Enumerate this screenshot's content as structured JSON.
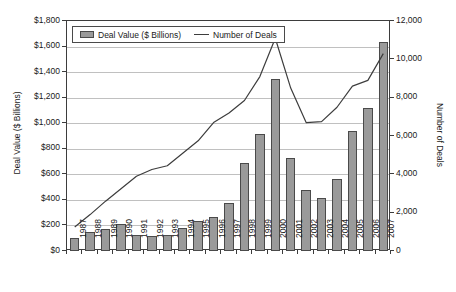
{
  "chart_data": {
    "type": "bar",
    "title": "",
    "xlabel": "",
    "ylabel": "Deal Value ($ Billions)",
    "y2label": "Number of Deals",
    "ylim": [
      0,
      1800
    ],
    "y2lim": [
      0,
      12000
    ],
    "grid": true,
    "legend_position": "top-left-inside",
    "categories": [
      "1987",
      "1988",
      "1989",
      "1990",
      "1991",
      "1992",
      "1993",
      "1994",
      "1995",
      "1996",
      "1997",
      "1998",
      "1999",
      "2000",
      "2001",
      "2002",
      "2003",
      "2004",
      "2005",
      "2006",
      "2007"
    ],
    "y_ticks": [
      "$0",
      "$200",
      "$400",
      "$600",
      "$800",
      "$1,000",
      "$1,200",
      "$1,400",
      "$1,600",
      "$1,800"
    ],
    "y_tick_values": [
      0,
      200,
      400,
      600,
      800,
      1000,
      1200,
      1400,
      1600,
      1800
    ],
    "y2_ticks": [
      "0",
      "2,000",
      "4,000",
      "6,000",
      "8,000",
      "10,000",
      "12,000"
    ],
    "y2_tick_values": [
      0,
      2000,
      4000,
      6000,
      8000,
      10000,
      12000
    ],
    "series": [
      {
        "name": "Deal Value ($ Billions)",
        "kind": "bar",
        "axis": "left",
        "color": "#9a9a9a",
        "edge_color": "#4a4a4a",
        "values": [
          100,
          145,
          170,
          208,
          122,
          118,
          128,
          178,
          235,
          268,
          375,
          690,
          915,
          1350,
          730,
          480,
          415,
          560,
          940,
          1120,
          1635
        ]
      },
      {
        "name": "Number of Deals",
        "kind": "line",
        "axis": "right",
        "color": "#3d3d3d",
        "values": [
          1250,
          1900,
          2600,
          3250,
          3900,
          4250,
          4450,
          5100,
          5750,
          6700,
          7200,
          7850,
          9100,
          11100,
          8500,
          6700,
          6750,
          7500,
          8600,
          8900,
          10300
        ]
      }
    ]
  },
  "legend": {
    "entries": [
      {
        "label": "Deal Value ($ Billions)",
        "marker": "bar-swatch-icon"
      },
      {
        "label": "Number of Deals",
        "marker": "line-swatch-icon"
      }
    ]
  }
}
